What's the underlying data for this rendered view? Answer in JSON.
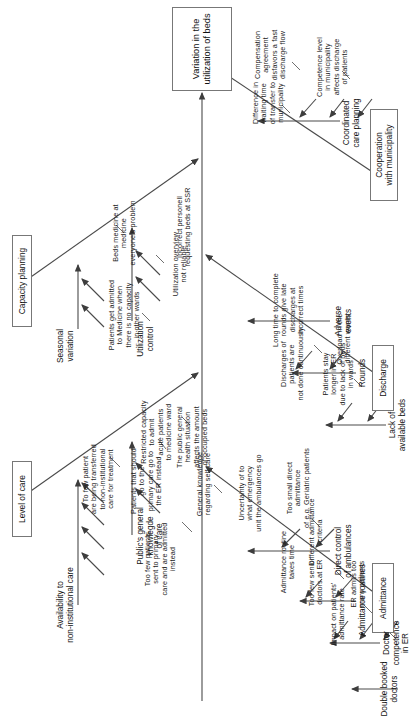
{
  "diagram": {
    "type": "fishbone-ishikawa",
    "effect": "Variation in the\nutilization of beds",
    "categories": [
      {
        "id": "level-of-care",
        "label": "Level of care",
        "side": "upper",
        "bones": [
          {
            "name": "Public's general\nknowlegde\nof care",
            "causes": [
              "General knowledge\nregarding self care",
              "The public general\nhealth situation\naffects the amount\nof occupied beds"
            ]
          },
          {
            "name": "Availability to\nnon-institutional care",
            "causes": [
              "Too few patients\nsent to primary\ncare and are admitted\ninstead",
              "Patients that should\ngo to the\nprimary care go to\nthe ER instead",
              "To few patient\nare being transferred\nto non-institutional\ncare for treatment",
              "Restricted capacity\nto admit\nacute patients\nto medicine ward"
            ]
          }
        ]
      },
      {
        "id": "capacity-planning",
        "label": "Capacity planning",
        "side": "upper",
        "bones": [
          {
            "name": "Utilization\ncontrol",
            "causes": [
              "Utilization overview\nnot reliable",
              "Incorrect personell\nrequesting beds at SSR"
            ]
          },
          {
            "name": "Seasonal\nvariation",
            "causes": [
              "Patients get admitted\nto Medicine when\nthere is no capacity\nin other wards",
              "Beds medicine at\nmedicine\neveryone's problem"
            ]
          }
        ]
      },
      {
        "id": "cooperation-with-municipality",
        "label": "Cooperation\nwith municipality",
        "side": "lower",
        "bones": [
          {
            "name": "Coordinated\ncare planning",
            "causes": [
              "Difference in\nwaiting time\nof transfer to\nmunicipality",
              "Competence level\nin municipality\naffects discharge\nof patients",
              "Compensation\nagreement\ndisfavors a fast\ndischarge flow"
            ]
          }
        ]
      },
      {
        "id": "discharge",
        "label": "Discharge",
        "side": "lower",
        "bones": [
          {
            "name": "Adverse\nevents",
            "causes": []
          },
          {
            "name": "Rounds",
            "causes": [
              "Discharges of\npatients are\nnot done continuously",
              "Long time to complete\nrounds give late\ndischarges at\nincorrect times"
            ]
          },
          {
            "name": "Lack of\navailable beds",
            "causes": [
              "Patients stay\nlonger in ER\ndue to lack of beds\nin wards",
              "Overload in the\ndifferent wards"
            ]
          }
        ]
      },
      {
        "id": "admittance",
        "label": "Admittance",
        "side": "lower",
        "bones": [
          {
            "name": "Direct control\nof ambulances",
            "causes": [
              "Uncertainty of to\nwhat emergency\nunit the ambulances go",
              "Too small direct\nadmittance\nof e.g. Geriatric patients"
            ]
          },
          {
            "name": "Admittance routines",
            "causes": [
              "Admittance routine\ntakes time",
              "Different admittance\n-criteria"
            ]
          },
          {
            "name": "Doctor\ncompetence\nin ER",
            "causes": [
              "Impact on patients'\nadmittance rate",
              "ER admits too\nmany patients",
              "Too few senior\ndoctors at ER"
            ]
          },
          {
            "name": "Double booked\ndoctors",
            "causes": []
          }
        ]
      }
    ]
  },
  "style": {
    "line_color": "#4a4a4a",
    "box_border": "#777777",
    "text_color": "#1a1a1a",
    "background": "#ffffff"
  },
  "labels": {
    "effect": "Variation in the\nutilization of beds",
    "cat_level_of_care": "Level of care",
    "cat_capacity_planning": "Capacity planning",
    "cat_cooperation": "Cooperation\nwith municipality",
    "cat_discharge": "Discharge",
    "cat_admittance": "Admittance",
    "b_publics_knowledge": "Public's general\nknowlegde\nof care",
    "b_availability": "Availability to\nnon-institutional care",
    "b_utilization_control": "Utilization\ncontrol",
    "b_seasonal_variation": "Seasonal\nvariation",
    "b_coordinated_care": "Coordinated\ncare planning",
    "b_adverse_events": "Adverse\nevents",
    "b_rounds": "Rounds",
    "b_lack_of_beds": "Lack of\navailable beds",
    "b_direct_control": "Direct control\nof ambulances",
    "b_admittance_routines": "Admittance routines",
    "b_doctor_competence": "Doctor\ncompetence\nin ER",
    "b_double_booked": "Double booked\ndoctors",
    "c_general_knowledge": "General knowledge\nregarding self care",
    "c_public_health": "The public general\nhealth situation\naffects the amount\nof occupied beds",
    "c_too_few_primary": "Too few patients\nsent to primary\ncare and are admitted\ninstead",
    "c_patients_should_go": "Patients that should\ngo to the\nprimary care go to\nthe ER instead",
    "c_to_few_transferred": "To few patient\nare being transferred\nto non-institutional\ncare for treatment",
    "c_restricted_capacity": "Restricted capacity\nto admit\nacute patients\nto medicine ward",
    "c_utilization_overview": "Utilization overview\nnot reliable",
    "c_incorrect_personell": "Incorrect personell\nrequesting beds at SSR",
    "c_patients_admitted_medicine": "Patients get admitted\nto Medicine when\nthere is no capacity\nin other wards",
    "c_beds_medicine": "Beds medicine at\nmedicine\neveryone's problem",
    "c_difference_waiting": "Difference in\nwaiting time\nof transfer to\nmunicipality",
    "c_competence_level": "Competence level\nin municipality\naffects discharge\nof patients",
    "c_compensation": "Compensation\nagreement\ndisfavors a fast\ndischarge flow",
    "c_discharges_not_cont": "Discharges of\npatients are\nnot done continuously",
    "c_long_time_rounds": "Long time to complete\nrounds give late\ndischarges at\nincorrect times",
    "c_patients_stay_longer": "Patients stay\nlonger in ER\ndue to lack of beds\nin wards",
    "c_overload_wards": "Overload in the\ndifferent wards",
    "c_uncertainty_ambulances": "Uncertainty of to\nwhat emergency\nunit the ambulances go",
    "c_too_small_direct": "Too small direct\nadmittance\nof e.g. Geriatric patients",
    "c_admittance_routine_time": "Admittance routine\ntakes time",
    "c_different_criteria": "Different admittance\n-criteria",
    "c_impact_admittance_rate": "Impact on patients'\nadmittance rate",
    "c_er_admits_too_many": "ER admits too\nmany patients",
    "c_too_few_senior": "Too few senior\ndoctors at ER"
  }
}
